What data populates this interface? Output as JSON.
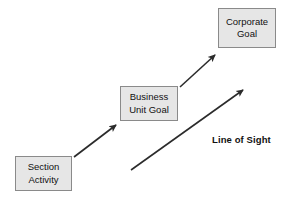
{
  "diagram": {
    "nodes": [
      {
        "id": "section-activity",
        "line1": "Section",
        "line2": "Activity",
        "fill": "#e6e6e6",
        "border": "#8a8a8a"
      },
      {
        "id": "business-unit-goal",
        "line1": "Business",
        "line2": "Unit Goal",
        "fill": "#e6e6e6",
        "border": "#8a8a8a"
      },
      {
        "id": "corporate-goal",
        "line1": "Corporate",
        "line2": "Goal",
        "fill": "#e6e6e6",
        "border": "#8a8a8a"
      }
    ],
    "labels": {
      "line_of_sight": "Line of Sight"
    },
    "connectors": [
      {
        "id": "arrow-section-to-business",
        "from": "section-activity",
        "to": "business-unit-goal",
        "color": "#2b2b2b"
      },
      {
        "id": "arrow-business-to-corporate",
        "from": "business-unit-goal",
        "to": "corporate-goal",
        "color": "#2b2b2b"
      },
      {
        "id": "arrow-line-of-sight",
        "from": "section-activity",
        "to": "corporate-goal",
        "color": "#2b2b2b"
      }
    ],
    "caption_partial": ""
  }
}
